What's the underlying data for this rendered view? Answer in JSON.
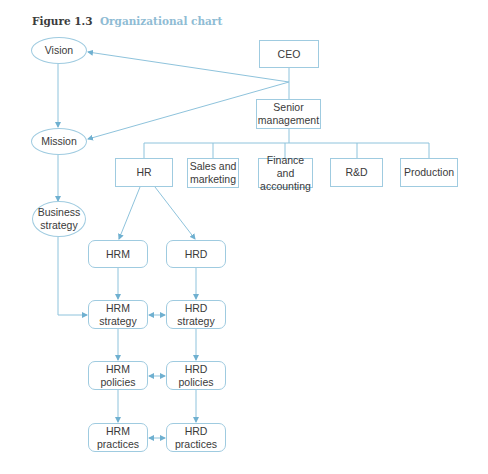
{
  "caption": {
    "number": "Figure 1.3",
    "title": "Organizational chart"
  },
  "colors": {
    "line": "#8ec3dc",
    "border": "#9fcbe0",
    "caption_accent": "#8fbcd4",
    "text": "#3a3a3a"
  },
  "nodes": {
    "vision": "Vision",
    "mission": "Mission",
    "business_strategy": "Business strategy",
    "ceo": "CEO",
    "senior_management": "Senior management",
    "hr": "HR",
    "sales_marketing": "Sales and marketing",
    "finance_accounting": "Finance and accounting",
    "rnd": "R&D",
    "production": "Production",
    "hrm": "HRM",
    "hrd": "HRD",
    "hrm_strategy": "HRM strategy",
    "hrd_strategy": "HRD strategy",
    "hrm_policies": "HRM policies",
    "hrd_policies": "HRD policies",
    "hrm_practices": "HRM practices",
    "hrd_practices": "HRD practices"
  }
}
